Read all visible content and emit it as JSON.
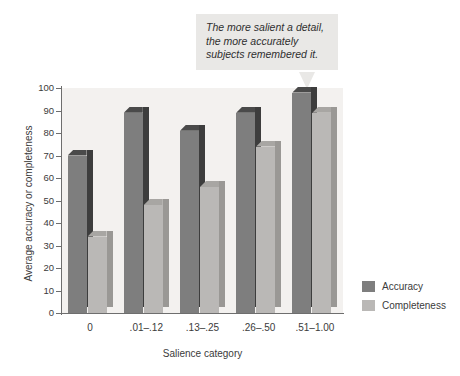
{
  "chart_data": {
    "type": "bar",
    "title": "",
    "subtitle": "",
    "xlabel": "Salience category",
    "ylabel": "Average accuracy or completeness",
    "categories": [
      "0",
      ".01–.12",
      ".13–.25",
      ".26–.50",
      ".51–1.00"
    ],
    "series": [
      {
        "name": "Accuracy",
        "color": "#7e7e7e",
        "values": [
          70,
          89,
          81,
          89,
          98
        ]
      },
      {
        "name": "Completeness",
        "color": "#bab8b6",
        "values": [
          34,
          48,
          56,
          74,
          89
        ]
      }
    ],
    "ylim": [
      0,
      100
    ],
    "yticks": [
      0,
      10,
      20,
      30,
      40,
      50,
      60,
      70,
      80,
      90,
      100
    ],
    "grid": false,
    "legend_position": "right",
    "annotations": [
      {
        "name": "callout",
        "lines": [
          "The more salient a detail,",
          "the more accurately",
          "subjects remembered it."
        ],
        "points_to": "Accuracy bar of category .51–1.00"
      }
    ]
  },
  "callout": {
    "line1": "The more salient a detail,",
    "line2": "the more accurately",
    "line3": "subjects remembered it."
  },
  "axes": {
    "y_title": "Average accuracy or completeness",
    "x_title": "Salience category"
  },
  "legend": {
    "items": [
      {
        "label": "Accuracy"
      },
      {
        "label": "Completeness"
      }
    ]
  }
}
